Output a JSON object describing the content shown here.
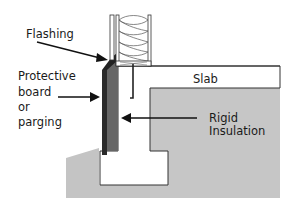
{
  "diagram": {
    "type": "slab-on-grade foundation cross-section",
    "labels": {
      "flashing": "Flashing",
      "protective_line1": "Protective",
      "protective_line2": "board",
      "protective_line3": "or",
      "protective_line4": "parging",
      "slab": "Slab",
      "rigid_line1": "Rigid",
      "rigid_line2": "Insulation"
    },
    "colors": {
      "soil": "#c4c4c4",
      "concrete": "#ffffff",
      "insulation": "#6a6a6a",
      "protective_board": "#2a2a2a",
      "outline": "#333333"
    }
  }
}
